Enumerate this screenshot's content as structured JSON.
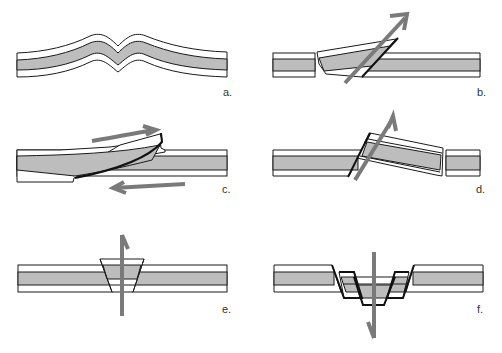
{
  "figure": {
    "colors": {
      "background": "#ffffff",
      "stratum_fill_gray": "#bdbdbd",
      "stratum_fill_white": "#ffffff",
      "outline": "#1a1a1a",
      "arrow": "#7a7a7a"
    },
    "panels": [
      {
        "id": "a",
        "label": "a.",
        "depicts": "folded strata (anticline/syncline bend)"
      },
      {
        "id": "b",
        "label": "b.",
        "depicts": "reverse fault with upward-tilted block"
      },
      {
        "id": "c",
        "label": "c.",
        "depicts": "thrust fault with opposing shear arrows"
      },
      {
        "id": "d",
        "label": "d.",
        "depicts": "reverse fault with tilted hanging block"
      },
      {
        "id": "e",
        "label": "e.",
        "depicts": "horst, block pushed upward"
      },
      {
        "id": "f",
        "label": "f.",
        "depicts": "graben, stepped blocks dropped downward"
      }
    ]
  }
}
